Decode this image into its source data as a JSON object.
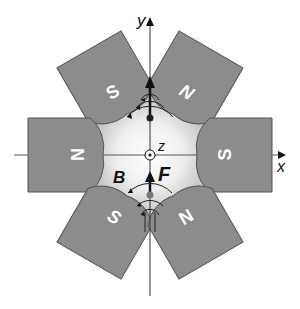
{
  "diagram": {
    "type": "hexapole magnet arrangement",
    "axes": {
      "x_label": "x",
      "y_label": "y",
      "z_label": "z"
    },
    "field_label": "B",
    "force_label": "F",
    "magnets": [
      {
        "id": "top-left",
        "pole": "S",
        "angle_deg": 120
      },
      {
        "id": "top-right",
        "pole": "N",
        "angle_deg": 60
      },
      {
        "id": "left",
        "pole": "N",
        "angle_deg": 180
      },
      {
        "id": "right",
        "pole": "S",
        "angle_deg": 0
      },
      {
        "id": "bottom-left",
        "pole": "S",
        "angle_deg": 240
      },
      {
        "id": "bottom-right",
        "pole": "N",
        "angle_deg": 300
      }
    ],
    "colors": {
      "magnet_fill": "#8c8c8c",
      "magnet_stroke": "#555555",
      "pole_text": "#ffffff",
      "gap_light": "#f4f4f4",
      "gap_dark": "#b0b0b0",
      "line": "#111111"
    }
  }
}
